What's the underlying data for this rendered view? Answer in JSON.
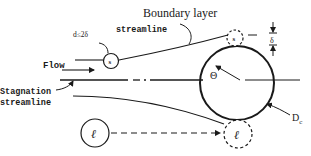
{
  "labels": {
    "boundary_layer": "Boundary layer",
    "streamline_top": "streamline",
    "d_condition": "d≤2δ",
    "flow": "Flow",
    "stagnation_line1": "Stagnation",
    "stagnation_line2": "streamline",
    "particle_small": "s",
    "particle_small_contact": "s",
    "particle_large": "ℓ",
    "particle_large_contact": "ℓ",
    "theta": "Θ",
    "delta": "δ",
    "collector_diameter_main": "D",
    "collector_diameter_sub": "c"
  },
  "colors": {
    "ink": "#1a1a1a",
    "background": "#ffffff"
  }
}
